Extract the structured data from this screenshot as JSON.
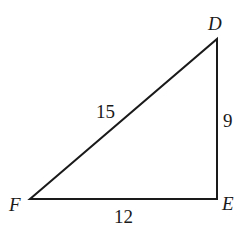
{
  "figure": {
    "type": "right-triangle",
    "vertices": [
      {
        "name": "D",
        "x": 217,
        "y": 39,
        "label_x": 208,
        "label_y": 30
      },
      {
        "name": "E",
        "x": 217,
        "y": 199,
        "label_x": 222,
        "label_y": 210
      },
      {
        "name": "F",
        "x": 30,
        "y": 199,
        "label_x": 9,
        "label_y": 211
      }
    ],
    "sides": [
      {
        "name": "DF",
        "length": "15",
        "label_x": 96,
        "label_y": 118
      },
      {
        "name": "DE",
        "length": "9",
        "label_x": 223,
        "label_y": 127
      },
      {
        "name": "FE",
        "length": "12",
        "label_x": 114,
        "label_y": 223
      }
    ],
    "right_angle_at": "E",
    "stroke_color": "#1a1a1a"
  }
}
